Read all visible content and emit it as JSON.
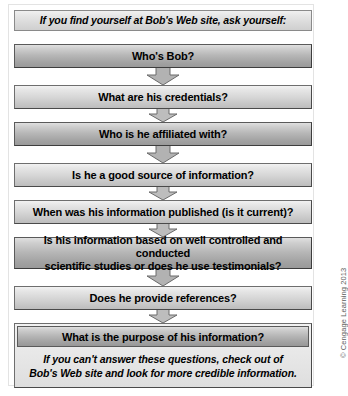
{
  "figure": {
    "title": "If you find yourself at Bob's Web site, ask yourself:",
    "credit": "© Cengage Learning 2013"
  },
  "steps": [
    {
      "id": "step-1",
      "label": "Who's Bob?",
      "shade": "dark",
      "lines": 1
    },
    {
      "id": "step-2",
      "label": "What are his credentials?",
      "shade": "light",
      "lines": 1
    },
    {
      "id": "step-3",
      "label": "Who is he affiliated with?",
      "shade": "dark",
      "lines": 1
    },
    {
      "id": "step-4",
      "label": "Is he a good source of information?",
      "shade": "light",
      "lines": 1
    },
    {
      "id": "step-5",
      "label": "When was his information published (is it current)?",
      "shade": "light",
      "lines": 1
    },
    {
      "id": "step-6",
      "label_line1": "Is his information based on well controlled and conducted",
      "label_line2": "scientific studies or does he use testimonials?",
      "shade": "dark",
      "lines": 2
    },
    {
      "id": "step-7",
      "label": "Does he provide references?",
      "shade": "light",
      "lines": 1
    }
  ],
  "final": {
    "bar_label": "What is the purpose of his information?",
    "note_line1": "If you can't answer these questions, check out of",
    "note_line2": "Bob's Web site and look for more credible information."
  },
  "colors": {
    "box_border": "#6e6e6e",
    "box_light_top": "#f2f2f2",
    "box_light_bottom": "#bdbdbd",
    "box_dark_top": "#e0e0e0",
    "box_dark_bottom": "#9a9a9a",
    "arrow_fill": "#b0b0b0",
    "arrow_border": "#6a6a6a",
    "text": "#000000",
    "credit_text": "#5c5c5c",
    "frame": "#e3e3e3",
    "background": "#ffffff"
  }
}
